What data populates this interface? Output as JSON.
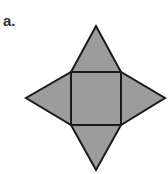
{
  "figure": {
    "label": "a.",
    "fill_color": "#9c9c9c",
    "stroke_color": "#1a1a1a",
    "stroke_width": 2,
    "square": {
      "x1": 71,
      "y1": 72,
      "x2": 121,
      "y2": 125
    },
    "apexes": {
      "top": [
        96,
        26
      ],
      "left": [
        26,
        98
      ],
      "right": [
        165,
        98
      ],
      "bottom": [
        96,
        170
      ]
    }
  }
}
